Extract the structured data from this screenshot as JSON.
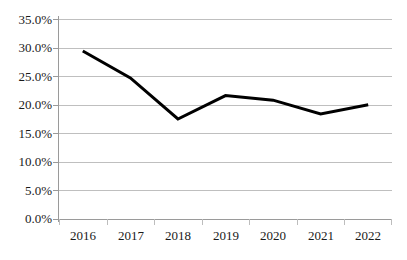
{
  "chart_data": {
    "type": "line",
    "title": "",
    "subtitle": "",
    "xlabel": "",
    "ylabel": "",
    "categories": [
      "2016",
      "2017",
      "2018",
      "2019",
      "2020",
      "2021",
      "2022"
    ],
    "values": [
      29.4,
      24.7,
      17.5,
      21.6,
      20.8,
      18.4,
      20.0
    ],
    "series": [
      {
        "name": "",
        "values": [
          29.4,
          24.7,
          17.5,
          21.6,
          20.8,
          18.4,
          20.0
        ]
      }
    ],
    "ylim": [
      0,
      35
    ],
    "ytick_step": 5,
    "ytick_labels": [
      "0.0%",
      "5.0%",
      "10.0%",
      "15.0%",
      "20.0%",
      "25.0%",
      "30.0%",
      "35.0%"
    ],
    "ytick_values": [
      0,
      5,
      10,
      15,
      20,
      25,
      30,
      35
    ],
    "xtick_labels": [
      "2016",
      "2017",
      "2018",
      "2019",
      "2020",
      "2021",
      "2022"
    ],
    "grid": true,
    "grid_axis": "y",
    "legend": false,
    "legend_position": "none",
    "annotations": [],
    "line_color": "#000000",
    "line_width": 3,
    "gridline_color": "#BFBFBF",
    "axis_color": "#9A9A9A",
    "text_color": "#1A1A1A",
    "background": "#FFFFFF",
    "markers": false
  }
}
